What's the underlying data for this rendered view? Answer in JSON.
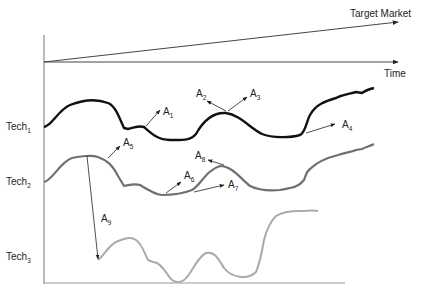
{
  "diagram": {
    "axis": {
      "time_label": "Time",
      "target_market_label": "Target Market"
    },
    "technologies": [
      {
        "name": "Tech",
        "sub": "1",
        "color": "#111111"
      },
      {
        "name": "Tech",
        "sub": "2",
        "color": "#6e6e6e"
      },
      {
        "name": "Tech",
        "sub": "3",
        "color": "#aaaaaa"
      }
    ],
    "annotations": [
      {
        "name": "A",
        "sub": "1"
      },
      {
        "name": "A",
        "sub": "2"
      },
      {
        "name": "A",
        "sub": "3"
      },
      {
        "name": "A",
        "sub": "4"
      },
      {
        "name": "A",
        "sub": "5"
      },
      {
        "name": "A",
        "sub": "6"
      },
      {
        "name": "A",
        "sub": "7"
      },
      {
        "name": "A",
        "sub": "8"
      },
      {
        "name": "A",
        "sub": "9"
      }
    ],
    "colors": {
      "axis": "#555555",
      "arrow": "#222222"
    }
  }
}
